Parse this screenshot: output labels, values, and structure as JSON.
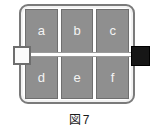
{
  "figure": {
    "caption_prefix": "図",
    "caption_number": "7",
    "caption_full": "図 7",
    "colors": {
      "cell_fill": "#8f8f8f",
      "cell_border": "#6f6f6f",
      "cell_label": "#f4f4f4",
      "frame_border": "#7a7a7a",
      "frame_inner": "#ffffff",
      "band": "#ffffff",
      "handle_left_fill": "#fbfbfb",
      "handle_left_border": "#6e6e6e",
      "handle_right_fill": "#161616",
      "background": "#ffffff",
      "caption_text": "#1a1a1a"
    },
    "grid": {
      "columns": 3,
      "rows": 2,
      "cells": [
        {
          "id": "cell-a",
          "label": "a",
          "row": 1,
          "col": 1
        },
        {
          "id": "cell-b",
          "label": "b",
          "row": 1,
          "col": 2
        },
        {
          "id": "cell-c",
          "label": "c",
          "row": 1,
          "col": 3
        },
        {
          "id": "cell-d",
          "label": "d",
          "row": 2,
          "col": 1
        },
        {
          "id": "cell-e",
          "label": "e",
          "row": 2,
          "col": 2
        },
        {
          "id": "cell-f",
          "label": "f",
          "row": 2,
          "col": 3
        }
      ]
    },
    "handles": {
      "left": {
        "name": "left-handle-square",
        "style": "outlined-light"
      },
      "right": {
        "name": "right-handle-square",
        "style": "solid-black"
      }
    }
  }
}
